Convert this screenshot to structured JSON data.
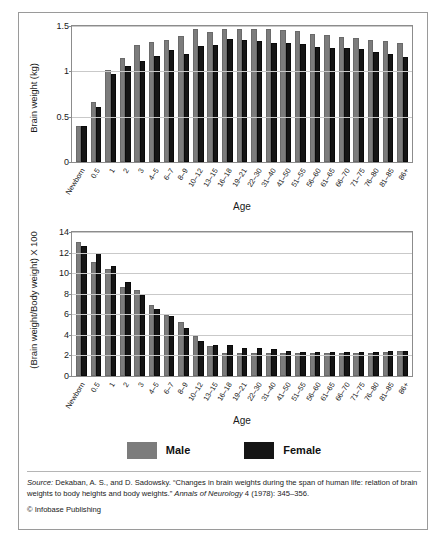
{
  "figure": {
    "legend": {
      "items": [
        {
          "label": "Male",
          "color": "#7c7c7c",
          "swatch": "male"
        },
        {
          "label": "Female",
          "color": "#151515",
          "swatch": "female"
        }
      ]
    },
    "caption": {
      "source_word": "Source:",
      "line1": " Dekaban, A. S., and D. Sadowsky. “Changes in brain weights during the span of human life:",
      "line2_pre": "relation of brain weights to body heights and body weights.” ",
      "journal": "Annals of Neurology",
      "line2_post": " 4 (1978): 345–356."
    },
    "copyright": "© Infobase Publishing"
  },
  "chart_data": [
    {
      "id": "brain-weight",
      "type": "bar",
      "title": "",
      "xlabel": "Age",
      "ylabel": "Brain weight (kg)",
      "ylim": [
        0,
        1.5
      ],
      "yticks": [
        0,
        0.5,
        1,
        1.5
      ],
      "ytick_labels": [
        "0",
        "0.5",
        "1",
        "1.5"
      ],
      "grid": true,
      "legend_position": "below-figure",
      "categories": [
        "Newborn",
        "0.5",
        "1",
        "2",
        "3",
        "4–5",
        "6–7",
        "8–9",
        "10–12",
        "13–15",
        "16–18",
        "19–21",
        "22–30",
        "31–40",
        "41–50",
        "51–55",
        "56–60",
        "61–65",
        "66–70",
        "71–75",
        "76–80",
        "81–85",
        "86+"
      ],
      "series": [
        {
          "name": "Male",
          "color": "#7c7c7c",
          "values": [
            0.38,
            0.64,
            0.99,
            1.12,
            1.27,
            1.3,
            1.32,
            1.37,
            1.44,
            1.41,
            1.44,
            1.45,
            1.44,
            1.44,
            1.43,
            1.42,
            1.39,
            1.38,
            1.36,
            1.35,
            1.32,
            1.31,
            1.29
          ]
        },
        {
          "name": "Female",
          "color": "#151515",
          "values": [
            0.37,
            0.58,
            0.95,
            1.04,
            1.09,
            1.15,
            1.21,
            1.17,
            1.26,
            1.27,
            1.33,
            1.32,
            1.31,
            1.29,
            1.29,
            1.28,
            1.25,
            1.24,
            1.23,
            1.22,
            1.19,
            1.17,
            1.14
          ]
        }
      ]
    },
    {
      "id": "brain-body-ratio",
      "type": "bar",
      "title": "",
      "xlabel": "Age",
      "ylabel": "(Brain weight/Body weight) X 100",
      "ylim": [
        0,
        14
      ],
      "yticks": [
        0,
        2,
        4,
        6,
        8,
        10,
        12,
        14
      ],
      "ytick_labels": [
        "0",
        "2",
        "4",
        "6",
        "8",
        "10",
        "12",
        "14"
      ],
      "grid": true,
      "legend_position": "below-figure",
      "categories": [
        "Newborn",
        "0.5",
        "1",
        "2",
        "3",
        "4–5",
        "6–7",
        "8–9",
        "10–12",
        "13–15",
        "16–18",
        "19–21",
        "22–30",
        "31–40",
        "41–50",
        "51–55",
        "56–60",
        "61–65",
        "66–70",
        "71–75",
        "76–80",
        "81–85",
        "86+"
      ],
      "series": [
        {
          "name": "Male",
          "color": "#7c7c7c",
          "values": [
            12.8,
            10.85,
            10.2,
            8.45,
            8.15,
            6.7,
            5.75,
            5.05,
            3.7,
            2.75,
            2.0,
            2.0,
            2.05,
            2.05,
            2.05,
            2.05,
            2.05,
            2.05,
            2.05,
            2.05,
            2.05,
            2.1,
            2.25
          ]
        },
        {
          "name": "Female",
          "color": "#151515",
          "values": [
            12.45,
            11.75,
            10.5,
            8.9,
            7.7,
            6.3,
            5.6,
            4.5,
            3.2,
            2.85,
            2.8,
            2.55,
            2.5,
            2.4,
            2.25,
            2.1,
            2.1,
            2.15,
            2.15,
            2.15,
            2.15,
            2.25,
            2.25
          ]
        }
      ]
    }
  ]
}
